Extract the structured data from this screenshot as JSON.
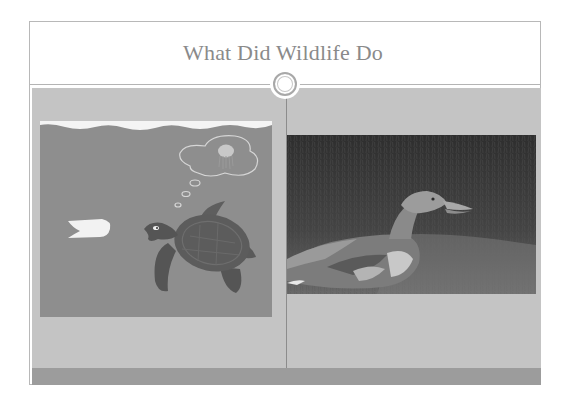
{
  "slide": {
    "title": "What Did Wildlife Do",
    "left_image": {
      "icon": "sea-turtle-plastic-bag-illustration",
      "description": "Sea turtle swimming toward a plastic bag, thinking it is a jellyfish"
    },
    "right_image": {
      "icon": "duck-photo",
      "description": "Injured duck lying in grass"
    }
  },
  "colors": {
    "title_text": "#8a8a8a",
    "frame_border": "#b8b8b8",
    "content_bg": "#c4c4c4",
    "bottom_band": "#9c9c9c",
    "turtle_bg": "#8e8e8e"
  }
}
